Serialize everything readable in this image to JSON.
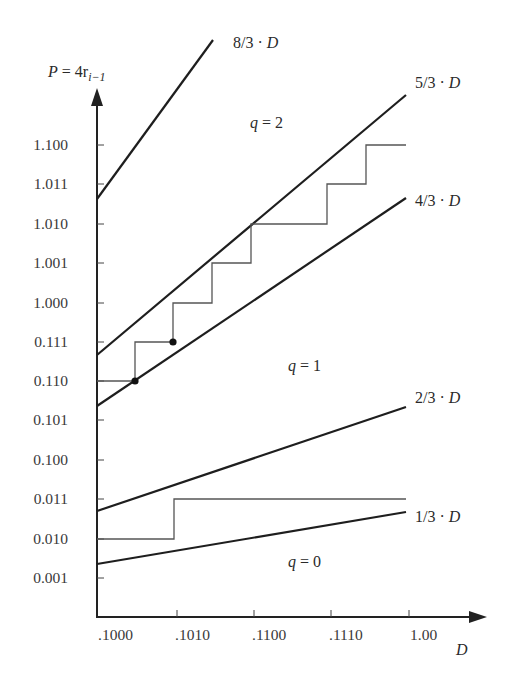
{
  "diagram": {
    "y_axis": {
      "label_lhs": "P",
      "label_eq": " = 4r",
      "label_sub": "i−1",
      "ticks": [
        "1.100",
        "1.011",
        "1.010",
        "1.001",
        "1.000",
        "0.111",
        "0.110",
        "0.101",
        "0.100",
        "0.011",
        "0.010",
        "0.001"
      ]
    },
    "x_axis": {
      "label": "D",
      "ticks": [
        ".1000",
        ".1010",
        ".1100",
        ".1110",
        "1.00"
      ]
    },
    "boundary_lines": [
      {
        "name": "8/3·D",
        "label_num": "8/3 · ",
        "label_var": "D"
      },
      {
        "name": "5/3·D",
        "label_num": "5/3 · ",
        "label_var": "D"
      },
      {
        "name": "4/3·D",
        "label_num": "4/3 · ",
        "label_var": "D"
      },
      {
        "name": "2/3·D",
        "label_num": "2/3 · ",
        "label_var": "D"
      },
      {
        "name": "1/3·D",
        "label_num": "1/3 · ",
        "label_var": "D"
      }
    ],
    "regions": [
      {
        "q_label": "q",
        "q_eq": " = 2"
      },
      {
        "q_label": "q",
        "q_eq": " = 1"
      },
      {
        "q_label": "q",
        "q_eq": " = 0"
      }
    ],
    "colors": {
      "line": "#1e1e1e",
      "staircase": "#555555",
      "background": "#ffffff"
    }
  }
}
